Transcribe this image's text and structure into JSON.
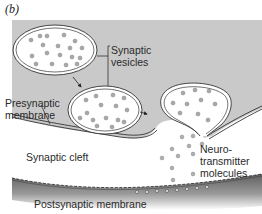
{
  "figure": {
    "panel_label": "(b)",
    "labels": {
      "synaptic_vesicles": [
        "Synaptic",
        "vesicles"
      ],
      "presynaptic_membrane": [
        "Presynaptic",
        "membrane"
      ],
      "synaptic_cleft": "Synaptic cleft",
      "neurotransmitter_molecules": [
        "Neuro-",
        "transmitter",
        "molecules"
      ],
      "postsynaptic_membrane": "Postsynaptic membrane"
    },
    "colors": {
      "presynaptic_terminal": "#c9c9c9",
      "vesicle_fill": "#ffffff",
      "molecule": "#a8a8a8",
      "postsynaptic_shadow": "#6e6e6e",
      "line": "#333333"
    }
  }
}
